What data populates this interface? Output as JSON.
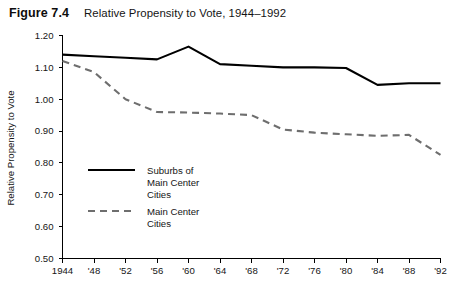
{
  "figure": {
    "number": "Figure 7.4",
    "title": "Relative Propensity to Vote, 1944–1992"
  },
  "chart_data": {
    "type": "line",
    "title": "Relative Propensity to Vote, 1944–1992",
    "xlabel": "",
    "ylabel": "Relative Propensity to Vote",
    "x": [
      1944,
      1948,
      1952,
      1956,
      1960,
      1964,
      1968,
      1972,
      1976,
      1980,
      1984,
      1988,
      1992
    ],
    "xtick_labels": [
      "1944",
      "'48",
      "'52",
      "'56",
      "'60",
      "'64",
      "'68",
      "'72",
      "'76",
      "'80",
      "'84",
      "'88",
      "'92"
    ],
    "ytick_labels": [
      "0.50",
      "0.60",
      "0.70",
      "0.80",
      "0.90",
      "1.00",
      "1.10",
      "1.20"
    ],
    "ytick_values": [
      0.5,
      0.6,
      0.7,
      0.8,
      0.9,
      1.0,
      1.1,
      1.2
    ],
    "ylim": [
      0.5,
      1.2
    ],
    "xlim": [
      1944,
      1992
    ],
    "grid": false,
    "legend_position": "inside-left",
    "series": [
      {
        "name": "Suburbs of Main Center Cities",
        "style": "solid",
        "color": "#000000",
        "values": [
          1.14,
          1.135,
          1.13,
          1.125,
          1.165,
          1.11,
          1.105,
          1.1,
          1.1,
          1.098,
          1.045,
          1.05,
          1.05
        ]
      },
      {
        "name": "Main Center Cities",
        "style": "dashed",
        "color": "#6e6e6e",
        "values": [
          1.12,
          1.085,
          1.0,
          0.96,
          0.958,
          0.955,
          0.95,
          0.905,
          0.895,
          0.89,
          0.885,
          0.888,
          0.825
        ]
      }
    ]
  },
  "legend": {
    "entries": [
      {
        "label_line1": "Suburbs of",
        "label_line2": "Main Center",
        "label_line3": "Cities",
        "style": "solid"
      },
      {
        "label_line1": "Main Center",
        "label_line2": "Cities",
        "label_line3": "",
        "style": "dashed"
      }
    ]
  }
}
